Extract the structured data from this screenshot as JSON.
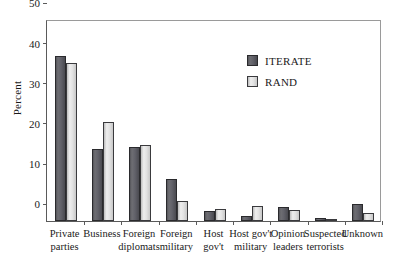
{
  "chart_data": {
    "type": "bar",
    "title": "",
    "xlabel": "",
    "ylabel": "Percent",
    "ylim": [
      0,
      50
    ],
    "yticks": [
      0,
      10,
      20,
      30,
      40,
      50
    ],
    "grid": false,
    "legend_position": "upper-right",
    "categories": [
      "Private parties",
      "Business",
      "Foreign diplomats",
      "Foreign military",
      "Host gov't",
      "Host gov't military",
      "Opinion leaders",
      "Suspected terrorists",
      "Unknown"
    ],
    "category_lines": [
      [
        "Private",
        "parties"
      ],
      [
        "Business"
      ],
      [
        "Foreign",
        "diplomats"
      ],
      [
        "Foreign",
        "military"
      ],
      [
        "Host",
        "gov't"
      ],
      [
        "Host gov't",
        "military"
      ],
      [
        "Opinion",
        "leaders"
      ],
      [
        "Suspected",
        "terrorists"
      ],
      [
        "Unknown"
      ]
    ],
    "series": [
      {
        "name": "ITERATE",
        "color": "#62626a",
        "values": [
          41.0,
          18.0,
          18.4,
          10.4,
          2.6,
          1.3,
          3.6,
          0.8,
          4.3
        ]
      },
      {
        "name": "RAND",
        "color": "#e2e2e2",
        "values": [
          39.4,
          24.7,
          19.0,
          5.1,
          3.1,
          3.8,
          2.8,
          0.2,
          2.0
        ]
      }
    ]
  },
  "axis": {
    "y_title": "Percent",
    "y_tick_labels": [
      "50",
      "40",
      "30",
      "20",
      "10",
      "0"
    ]
  },
  "legend": {
    "items": [
      {
        "label": "ITERATE"
      },
      {
        "label": "RAND"
      }
    ]
  }
}
